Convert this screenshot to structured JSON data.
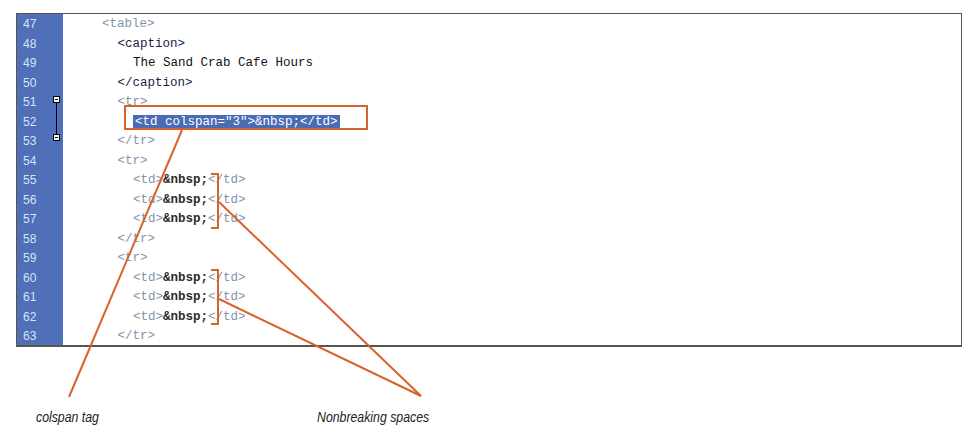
{
  "editor": {
    "lines": [
      {
        "num": "47",
        "indent": 2,
        "parts": [
          {
            "t": "<table>",
            "c": "tag"
          }
        ]
      },
      {
        "num": "48",
        "indent": 3,
        "parts": [
          {
            "t": "<caption>",
            "c": "tag-dark"
          }
        ]
      },
      {
        "num": "49",
        "indent": 4,
        "parts": [
          {
            "t": "The Sand Crab Cafe Hours",
            "c": "txt"
          }
        ]
      },
      {
        "num": "50",
        "indent": 3,
        "parts": [
          {
            "t": "</caption>",
            "c": "tag-dark"
          }
        ]
      },
      {
        "num": "51",
        "indent": 3,
        "parts": [
          {
            "t": "<tr>",
            "c": "tag"
          }
        ]
      },
      {
        "num": "52",
        "indent": 4,
        "parts": [
          {
            "t": "<td colspan=\"3\">&nbsp;</td>",
            "c": "sel"
          }
        ]
      },
      {
        "num": "53",
        "indent": 3,
        "parts": [
          {
            "t": "</tr>",
            "c": "tag"
          }
        ]
      },
      {
        "num": "54",
        "indent": 3,
        "parts": [
          {
            "t": "<tr>",
            "c": "tag"
          }
        ]
      },
      {
        "num": "55",
        "indent": 4,
        "parts": [
          {
            "t": "<td>",
            "c": "tag"
          },
          {
            "t": "&nbsp;",
            "c": "ent"
          },
          {
            "t": "</td>",
            "c": "tag"
          }
        ]
      },
      {
        "num": "56",
        "indent": 4,
        "parts": [
          {
            "t": "<td>",
            "c": "tag"
          },
          {
            "t": "&nbsp;",
            "c": "ent"
          },
          {
            "t": "</td>",
            "c": "tag"
          }
        ]
      },
      {
        "num": "57",
        "indent": 4,
        "parts": [
          {
            "t": "<td>",
            "c": "tag"
          },
          {
            "t": "&nbsp;",
            "c": "ent"
          },
          {
            "t": "</td>",
            "c": "tag"
          }
        ]
      },
      {
        "num": "58",
        "indent": 3,
        "parts": [
          {
            "t": "</tr>",
            "c": "tag"
          }
        ]
      },
      {
        "num": "59",
        "indent": 3,
        "parts": [
          {
            "t": "<tr>",
            "c": "tag"
          }
        ]
      },
      {
        "num": "60",
        "indent": 4,
        "parts": [
          {
            "t": "<td>",
            "c": "tag"
          },
          {
            "t": "&nbsp;",
            "c": "ent"
          },
          {
            "t": "</td>",
            "c": "tag"
          }
        ]
      },
      {
        "num": "61",
        "indent": 4,
        "parts": [
          {
            "t": "<td>",
            "c": "tag"
          },
          {
            "t": "&nbsp;",
            "c": "ent"
          },
          {
            "t": "</td>",
            "c": "tag"
          }
        ]
      },
      {
        "num": "62",
        "indent": 4,
        "parts": [
          {
            "t": "<td>",
            "c": "tag"
          },
          {
            "t": "&nbsp;",
            "c": "ent"
          },
          {
            "t": "</td>",
            "c": "tag"
          }
        ]
      },
      {
        "num": "63",
        "indent": 3,
        "parts": [
          {
            "t": "</tr>",
            "c": "tag"
          }
        ]
      }
    ],
    "fold_markers": [
      "51",
      "53"
    ]
  },
  "callouts": {
    "colspan": "colspan tag",
    "nbsp": "Nonbreaking spaces"
  },
  "colors": {
    "gutter": "#4f6fb8",
    "selection": "#4a6cb5",
    "annotation": "#d9622b"
  }
}
